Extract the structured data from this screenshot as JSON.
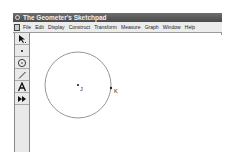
{
  "window": {
    "title": "The Geometer's Sketchpad"
  },
  "menubar": {
    "items": [
      "File",
      "Edit",
      "Display",
      "Construct",
      "Transform",
      "Measure",
      "Graph",
      "Window",
      "Help"
    ]
  },
  "toolbox": {
    "tools": [
      {
        "name": "selection-arrow-tool",
        "glyph": "arrow"
      },
      {
        "name": "point-tool",
        "glyph": "point"
      },
      {
        "name": "compass-tool",
        "glyph": "circle"
      },
      {
        "name": "straightedge-tool",
        "glyph": "line"
      },
      {
        "name": "text-tool",
        "glyph": "A"
      },
      {
        "name": "custom-tool",
        "glyph": "double-arrow"
      }
    ]
  },
  "sketch": {
    "circle": {
      "center_label": "J",
      "radius_point_label": "K"
    },
    "colors": {
      "circle": "#8a8a8a",
      "point": "#222222"
    }
  }
}
